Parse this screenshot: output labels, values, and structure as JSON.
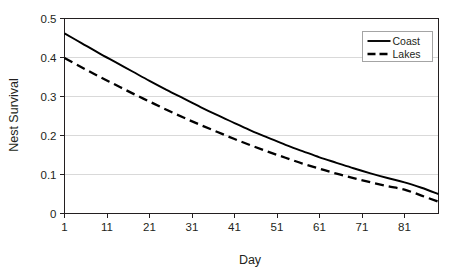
{
  "chart_data": {
    "type": "line",
    "title": "",
    "xlabel": "Day",
    "ylabel": "Nest Survival",
    "xlim": [
      1,
      89
    ],
    "ylim": [
      0,
      0.5
    ],
    "grid": true,
    "grid_axis": "y",
    "legend_position": "top-right",
    "background": "#ffffff",
    "gridline_color": "#d9d9d9",
    "axis_color": "#231f20",
    "xticks": [
      1,
      11,
      21,
      31,
      41,
      51,
      61,
      71,
      81
    ],
    "xtick_labels": [
      "1",
      "11",
      "21",
      "31",
      "41",
      "51",
      "61",
      "71",
      "81"
    ],
    "yticks": [
      0,
      0.1,
      0.2,
      0.3,
      0.4,
      0.5
    ],
    "ytick_labels": [
      "0",
      "0.1",
      "0.2",
      "0.3",
      "0.4",
      "0.5"
    ],
    "x": [
      1,
      5,
      9,
      13,
      17,
      21,
      25,
      29,
      33,
      37,
      41,
      45,
      49,
      53,
      57,
      61,
      65,
      69,
      73,
      77,
      81,
      85,
      89
    ],
    "series": [
      {
        "name": "Coast",
        "style": "solid",
        "color": "#000000",
        "width": 1.9,
        "values": [
          0.462,
          0.437,
          0.412,
          0.388,
          0.364,
          0.34,
          0.317,
          0.295,
          0.273,
          0.252,
          0.232,
          0.212,
          0.194,
          0.176,
          0.16,
          0.144,
          0.13,
          0.116,
          0.103,
          0.091,
          0.08,
          0.066,
          0.05
        ]
      },
      {
        "name": "Lakes",
        "style": "dashed",
        "color": "#000000",
        "width": 2.3,
        "dash": "9,5",
        "values": [
          0.399,
          0.375,
          0.352,
          0.33,
          0.308,
          0.287,
          0.266,
          0.246,
          0.227,
          0.209,
          0.191,
          0.174,
          0.158,
          0.143,
          0.128,
          0.115,
          0.102,
          0.091,
          0.08,
          0.07,
          0.061,
          0.046,
          0.03
        ]
      }
    ],
    "legend": [
      {
        "label": "Coast",
        "style": "solid"
      },
      {
        "label": "Lakes",
        "style": "dashed"
      }
    ]
  }
}
